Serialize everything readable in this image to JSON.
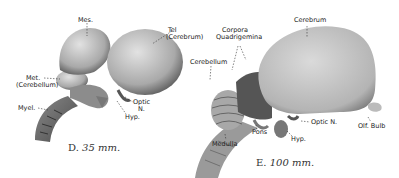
{
  "figures": [
    {
      "id": "D",
      "caption_letter": "D.",
      "caption_size": "35 mm.",
      "labels": {
        "mes": "Mes.",
        "tel_1": "Tel",
        "tel_2": "(Cerebrum)",
        "met_1": "Met.",
        "met_2": "(Cerebellum)",
        "myel": "Myel.",
        "optic_1": "Optic",
        "optic_2": "N.",
        "hyp": "Hyp."
      }
    },
    {
      "id": "E",
      "caption_letter": "E.",
      "caption_size": "100 mm.",
      "labels": {
        "cerebrum": "Cerebrum",
        "corpora_1": "Corpora",
        "corpora_2": "Quadrigemina",
        "cerebellum": "Cerebellum",
        "pons": "Pons",
        "medulla": "Medulla",
        "hyp": "Hyp.",
        "optic": "Optic N.",
        "olf_bulb": "Olf. Bulb"
      }
    }
  ]
}
